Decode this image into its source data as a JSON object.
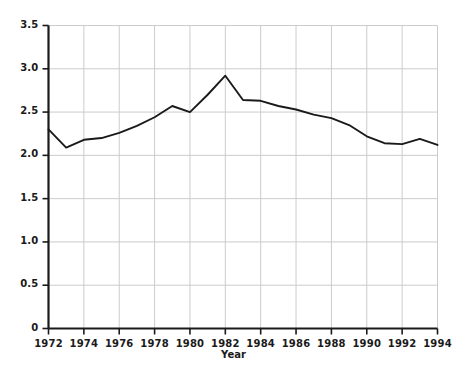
{
  "chart_data": {
    "type": "line",
    "title": "",
    "subtitle": "",
    "xlabel": "Year",
    "ylabel": "",
    "x": [
      1972,
      1973,
      1974,
      1975,
      1976,
      1977,
      1978,
      1979,
      1980,
      1981,
      1982,
      1983,
      1984,
      1985,
      1986,
      1987,
      1988,
      1989,
      1990,
      1991,
      1992,
      1993,
      1994
    ],
    "values": [
      2.3,
      2.09,
      2.18,
      2.2,
      2.26,
      2.34,
      2.44,
      2.57,
      2.5,
      2.7,
      2.92,
      2.64,
      2.63,
      2.57,
      2.53,
      2.47,
      2.43,
      2.35,
      2.22,
      2.14,
      2.13,
      2.19,
      2.12
    ],
    "series": [
      {
        "name": "value",
        "color": "#1a1a1a",
        "values": [
          2.3,
          2.09,
          2.18,
          2.2,
          2.26,
          2.34,
          2.44,
          2.57,
          2.5,
          2.7,
          2.92,
          2.64,
          2.63,
          2.57,
          2.53,
          2.47,
          2.43,
          2.35,
          2.22,
          2.14,
          2.13,
          2.19,
          2.12
        ]
      }
    ],
    "xlim": [
      1972,
      1994
    ],
    "ylim": [
      0,
      3.5
    ],
    "xticks": [
      1972,
      1974,
      1976,
      1978,
      1980,
      1982,
      1984,
      1986,
      1988,
      1990,
      1992,
      1994
    ],
    "xtick_labels": [
      "1972",
      "1974",
      "1976",
      "1978",
      "1980",
      "1982",
      "1984",
      "1986",
      "1988",
      "1990",
      "1992",
      "1994"
    ],
    "yticks": [
      0,
      0.5,
      1.0,
      1.5,
      2.0,
      2.5,
      3.0,
      3.5
    ],
    "ytick_labels": [
      "0",
      "0.5",
      "1.0",
      "1.5",
      "2.0",
      "2.5",
      "3.0",
      "3.5"
    ],
    "grid": true,
    "grid_color": "#cccccc",
    "axis_color": "#1a1a1a",
    "background": "#ffffff",
    "legend": null,
    "legend_position": "none",
    "annotations": []
  }
}
